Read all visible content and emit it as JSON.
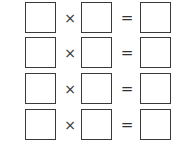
{
  "worksheet": {
    "rows": [
      {
        "left": "",
        "operator": "×",
        "right": "",
        "equals": "=",
        "result": ""
      },
      {
        "left": "",
        "operator": "×",
        "right": "",
        "equals": "=",
        "result": ""
      },
      {
        "left": "",
        "operator": "×",
        "right": "",
        "equals": "=",
        "result": ""
      },
      {
        "left": "",
        "operator": "×",
        "right": "",
        "equals": "=",
        "result": ""
      }
    ]
  }
}
